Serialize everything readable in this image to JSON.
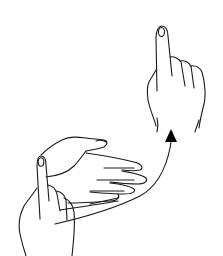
{
  "image": {
    "description": "Line drawing of two hands: lower-left hand with index finger up and flat hand extended; upper-right hand with index finger pointing up; a curved arrow sweeps from lower hand up to the upper hand's wrist.",
    "colors": {
      "background": "#ffffff",
      "line": "#1a1a1a",
      "arrow": "#000000"
    }
  }
}
